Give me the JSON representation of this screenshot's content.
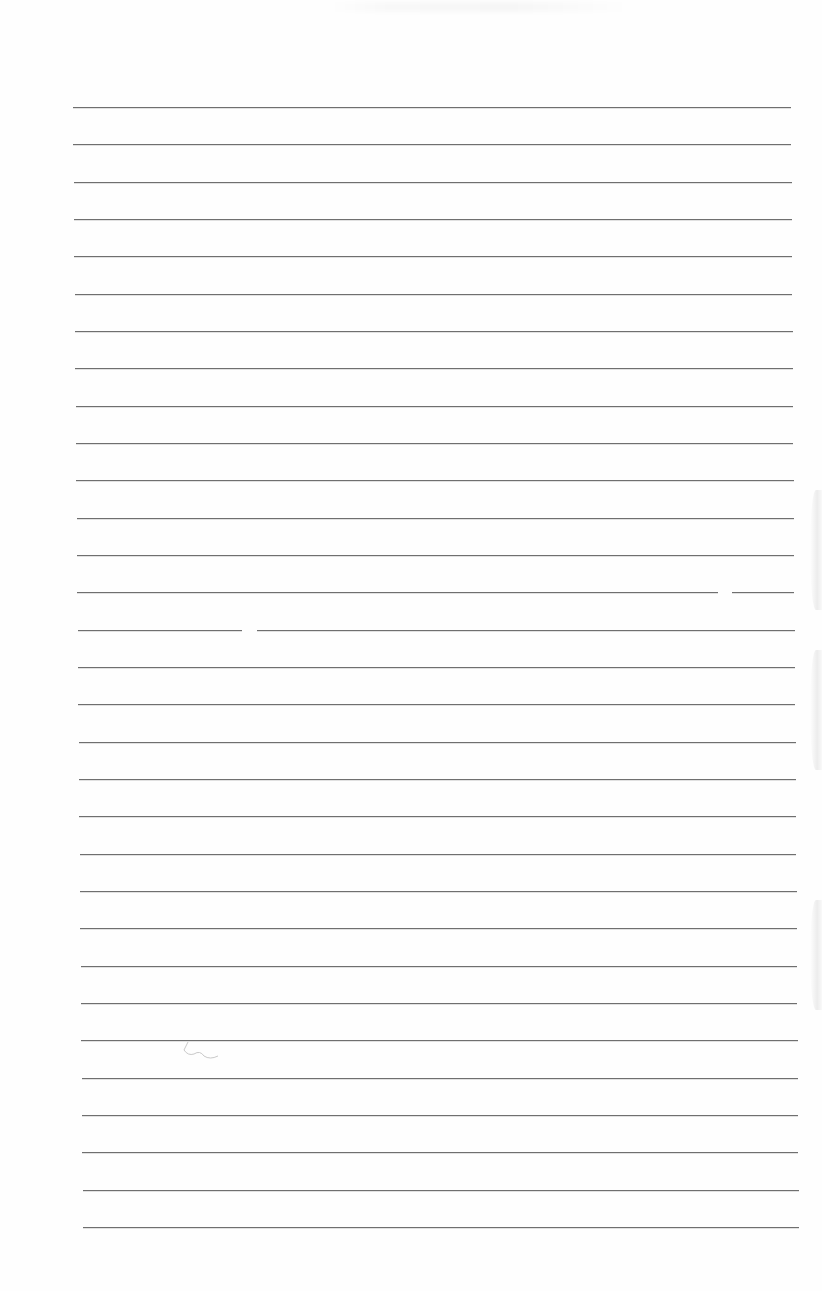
{
  "document": {
    "type": "blank-lined-paper",
    "ruled_lines": {
      "count": 31,
      "first_y": 107,
      "spacing": 37.33,
      "top_left_x": 73,
      "top_right_x": 791,
      "bottom_left_x": 83,
      "bottom_right_x": 799,
      "color": "#6f6f6f"
    },
    "line_gaps": [
      {
        "line_y": 630,
        "x_start": 242,
        "x_end": 257
      },
      {
        "line_y": 592,
        "x_start": 718,
        "x_end": 732
      }
    ],
    "edge_marks": [
      {
        "top": 490,
        "height": 120
      },
      {
        "top": 650,
        "height": 120
      },
      {
        "top": 900,
        "height": 110
      }
    ],
    "background_color": "#fefefe"
  }
}
